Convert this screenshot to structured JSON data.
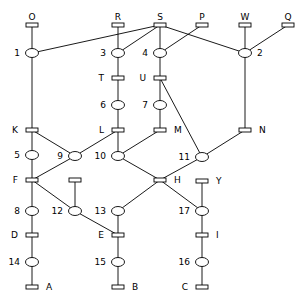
{
  "diagram": {
    "type": "petri-net",
    "colors": {
      "stroke": "#000000",
      "fill": "#ffffff",
      "text": "#000000"
    },
    "transitions": [
      {
        "id": "O",
        "label": "O",
        "x": 32,
        "y": 25,
        "labelPos": "top"
      },
      {
        "id": "R",
        "label": "R",
        "x": 118,
        "y": 25,
        "labelPos": "top"
      },
      {
        "id": "S",
        "label": "S",
        "x": 160,
        "y": 25,
        "labelPos": "top"
      },
      {
        "id": "P",
        "label": "P",
        "x": 202,
        "y": 25,
        "labelPos": "top"
      },
      {
        "id": "W",
        "label": "W",
        "x": 245,
        "y": 25,
        "labelPos": "top"
      },
      {
        "id": "Q",
        "label": "Q",
        "x": 288,
        "y": 25,
        "labelPos": "top"
      },
      {
        "id": "T",
        "label": "T",
        "x": 118,
        "y": 78,
        "labelPos": "left"
      },
      {
        "id": "U",
        "label": "U",
        "x": 160,
        "y": 78,
        "labelPos": "left"
      },
      {
        "id": "K",
        "label": "K",
        "x": 32,
        "y": 130,
        "labelPos": "left"
      },
      {
        "id": "L",
        "label": "L",
        "x": 118,
        "y": 130,
        "labelPos": "left"
      },
      {
        "id": "M",
        "label": "M",
        "x": 160,
        "y": 130,
        "labelPos": "right"
      },
      {
        "id": "N",
        "label": "N",
        "x": 245,
        "y": 130,
        "labelPos": "right"
      },
      {
        "id": "F",
        "label": "F",
        "x": 32,
        "y": 180,
        "labelPos": "left"
      },
      {
        "id": "X",
        "label": "",
        "x": 75,
        "y": 180,
        "labelPos": "none"
      },
      {
        "id": "H",
        "label": "H",
        "x": 160,
        "y": 180,
        "labelPos": "right"
      },
      {
        "id": "Y",
        "label": "Y",
        "x": 202,
        "y": 181,
        "labelPos": "right"
      },
      {
        "id": "D",
        "label": "D",
        "x": 32,
        "y": 235,
        "labelPos": "left"
      },
      {
        "id": "E",
        "label": "E",
        "x": 118,
        "y": 235,
        "labelPos": "left"
      },
      {
        "id": "I",
        "label": "I",
        "x": 202,
        "y": 235,
        "labelPos": "right"
      },
      {
        "id": "A",
        "label": "A",
        "x": 32,
        "y": 287,
        "labelPos": "right"
      },
      {
        "id": "B",
        "label": "B",
        "x": 118,
        "y": 287,
        "labelPos": "right"
      },
      {
        "id": "C",
        "label": "C",
        "x": 202,
        "y": 287,
        "labelPos": "left"
      }
    ],
    "places": [
      {
        "id": "1",
        "label": "1",
        "x": 32,
        "y": 53,
        "labelPos": "left"
      },
      {
        "id": "3",
        "label": "3",
        "x": 118,
        "y": 53,
        "labelPos": "left"
      },
      {
        "id": "4",
        "label": "4",
        "x": 160,
        "y": 53,
        "labelPos": "left"
      },
      {
        "id": "2",
        "label": "2",
        "x": 245,
        "y": 53,
        "labelPos": "right"
      },
      {
        "id": "6",
        "label": "6",
        "x": 118,
        "y": 105,
        "labelPos": "left"
      },
      {
        "id": "7",
        "label": "7",
        "x": 160,
        "y": 105,
        "labelPos": "left"
      },
      {
        "id": "5",
        "label": "5",
        "x": 32,
        "y": 155,
        "labelPos": "left"
      },
      {
        "id": "9",
        "label": "9",
        "x": 75,
        "y": 156,
        "labelPos": "left"
      },
      {
        "id": "10",
        "label": "10",
        "x": 118,
        "y": 156,
        "labelPos": "left"
      },
      {
        "id": "11",
        "label": "11",
        "x": 202,
        "y": 157,
        "labelPos": "left"
      },
      {
        "id": "8",
        "label": "8",
        "x": 32,
        "y": 211,
        "labelPos": "left"
      },
      {
        "id": "12",
        "label": "12",
        "x": 75,
        "y": 211,
        "labelPos": "left"
      },
      {
        "id": "13",
        "label": "13",
        "x": 118,
        "y": 211,
        "labelPos": "left"
      },
      {
        "id": "17",
        "label": "17",
        "x": 202,
        "y": 211,
        "labelPos": "left"
      },
      {
        "id": "14",
        "label": "14",
        "x": 32,
        "y": 262,
        "labelPos": "left"
      },
      {
        "id": "15",
        "label": "15",
        "x": 118,
        "y": 262,
        "labelPos": "left"
      },
      {
        "id": "16",
        "label": "16",
        "x": 202,
        "y": 262,
        "labelPos": "left"
      }
    ],
    "arcs": [
      [
        "O",
        "1"
      ],
      [
        "R",
        "3"
      ],
      [
        "S",
        "1"
      ],
      [
        "S",
        "3"
      ],
      [
        "S",
        "4"
      ],
      [
        "S",
        "2"
      ],
      [
        "P",
        "4"
      ],
      [
        "W",
        "2"
      ],
      [
        "Q",
        "2"
      ],
      [
        "1",
        "K"
      ],
      [
        "3",
        "T"
      ],
      [
        "4",
        "U"
      ],
      [
        "2",
        "N"
      ],
      [
        "T",
        "6"
      ],
      [
        "U",
        "7"
      ],
      [
        "U",
        "11"
      ],
      [
        "6",
        "L"
      ],
      [
        "7",
        "M"
      ],
      [
        "K",
        "5"
      ],
      [
        "K",
        "9"
      ],
      [
        "L",
        "9"
      ],
      [
        "L",
        "10"
      ],
      [
        "M",
        "10"
      ],
      [
        "N",
        "11"
      ],
      [
        "5",
        "F"
      ],
      [
        "9",
        "F"
      ],
      [
        "10",
        "H"
      ],
      [
        "11",
        "H"
      ],
      [
        "F",
        "8"
      ],
      [
        "F",
        "12"
      ],
      [
        "X",
        "12"
      ],
      [
        "H",
        "13"
      ],
      [
        "H",
        "17"
      ],
      [
        "Y",
        "17"
      ],
      [
        "8",
        "D"
      ],
      [
        "12",
        "E"
      ],
      [
        "13",
        "E"
      ],
      [
        "17",
        "I"
      ],
      [
        "D",
        "14"
      ],
      [
        "E",
        "15"
      ],
      [
        "I",
        "16"
      ],
      [
        "14",
        "A"
      ],
      [
        "15",
        "B"
      ],
      [
        "16",
        "C"
      ]
    ]
  }
}
